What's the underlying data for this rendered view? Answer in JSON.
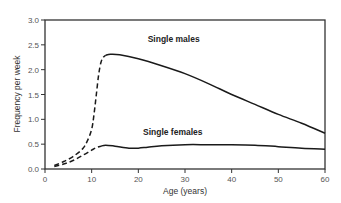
{
  "chart_data": {
    "type": "line",
    "title": "",
    "xlabel": "Age (years)",
    "ylabel": "Frequency per week",
    "xlim": [
      0,
      60
    ],
    "ylim": [
      0,
      3.0
    ],
    "xticks": [
      0,
      10,
      20,
      30,
      40,
      50,
      60
    ],
    "yticks": [
      "0.0",
      "0.5",
      "1.0",
      "1.5",
      "2.0",
      "2.5",
      "3.0"
    ],
    "grid": false,
    "legend": "inline labels",
    "series": [
      {
        "name": "Single males",
        "label_pos": {
          "x": 22,
          "y": 2.55
        },
        "dashed_segment": {
          "x": [
            2,
            4,
            6,
            8,
            9,
            10,
            10.5,
            11,
            11.5,
            12,
            12.5,
            13
          ],
          "y": [
            0.07,
            0.15,
            0.25,
            0.4,
            0.55,
            0.8,
            1.1,
            1.5,
            1.9,
            2.15,
            2.25,
            2.29
          ]
        },
        "solid_segment": {
          "x": [
            13,
            14,
            16,
            20,
            25,
            30,
            35,
            40,
            45,
            50,
            55,
            60
          ],
          "y": [
            2.29,
            2.31,
            2.3,
            2.22,
            2.08,
            1.92,
            1.72,
            1.5,
            1.3,
            1.1,
            0.92,
            0.72
          ]
        }
      },
      {
        "name": "Single females",
        "label_pos": {
          "x": 21,
          "y": 0.68
        },
        "dashed_segment": {
          "x": [
            2,
            4,
            6,
            8,
            10,
            11,
            12
          ],
          "y": [
            0.05,
            0.1,
            0.17,
            0.27,
            0.38,
            0.43,
            0.46
          ]
        },
        "solid_segment": {
          "x": [
            12,
            13,
            15,
            18,
            20,
            22,
            25,
            30,
            35,
            40,
            45,
            50,
            55,
            60
          ],
          "y": [
            0.46,
            0.48,
            0.46,
            0.42,
            0.42,
            0.44,
            0.47,
            0.49,
            0.49,
            0.49,
            0.48,
            0.45,
            0.42,
            0.4
          ]
        }
      }
    ]
  },
  "colors": {
    "axis": "#333333",
    "line": "#1a1a1a",
    "text": "#555555"
  }
}
